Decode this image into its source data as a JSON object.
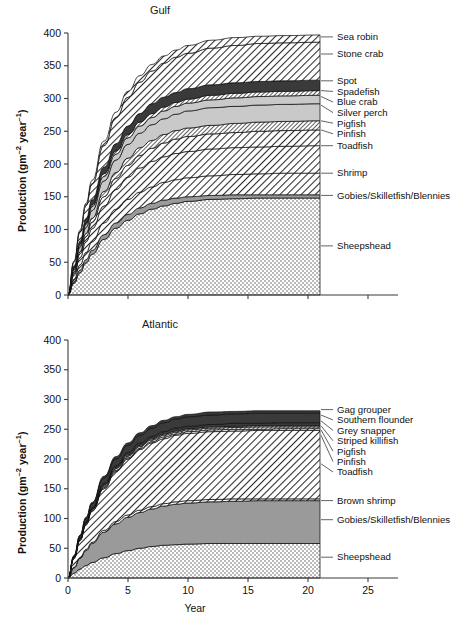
{
  "figure": {
    "axis_y_title_main": "Production (gm",
    "axis_y_title_sup1": "–2",
    "axis_y_title_mid": " year",
    "axis_y_title_sup2": "–1",
    "axis_y_title_end": ")",
    "axis_x_title": "Year",
    "ink": "#1a1a1a"
  },
  "chart_data": [
    {
      "type": "area",
      "title": "Gulf",
      "xlabel": "Year",
      "ylabel": "Production (gm−2 year−1)",
      "xlim": [
        0,
        27.5
      ],
      "ylim": [
        0,
        400
      ],
      "xticks": [
        0,
        5,
        10,
        15,
        20,
        25
      ],
      "yticks": [
        0,
        50,
        100,
        150,
        200,
        250,
        300,
        350,
        400
      ],
      "grid": false,
      "legend_position": "right-leader-lines",
      "stacked": true,
      "data_extent_x": 21,
      "x": [
        0,
        0.5,
        1,
        1.5,
        2,
        3,
        4,
        5,
        6,
        7,
        8,
        9,
        10,
        12,
        14,
        16,
        18,
        21
      ],
      "series": [
        {
          "name": "Sheepshead",
          "fill": "crosshatch",
          "label_y_value": 75,
          "cumulative": [
            0,
            18,
            34,
            49,
            62,
            85,
            102,
            114,
            124,
            131,
            136,
            140,
            143,
            146,
            147,
            148,
            148,
            148
          ]
        },
        {
          "name": "Gobies/Skilletfish/Blennies",
          "fill": "solid-mid-grey",
          "label_y_value": 152,
          "cumulative": [
            0,
            20,
            38,
            54,
            68,
            92,
            110,
            123,
            133,
            140,
            145,
            148,
            150,
            152,
            153,
            153,
            153,
            153
          ]
        },
        {
          "name": "Shrimp",
          "fill": "diagonal-hatch",
          "label_y_value": 186,
          "cumulative": [
            0,
            24,
            46,
            65,
            81,
            110,
            131,
            146,
            157,
            165,
            172,
            176,
            179,
            182,
            184,
            185,
            186,
            186
          ]
        },
        {
          "name": "Toadfish",
          "fill": "diagonal-hatch",
          "label_y_value": 228,
          "cumulative": [
            0,
            30,
            57,
            81,
            101,
            136,
            161,
            180,
            194,
            204,
            211,
            216,
            219,
            223,
            225,
            226,
            227,
            228
          ]
        },
        {
          "name": "Pinfish",
          "fill": "diagonal-hatch",
          "label_y_value": 252,
          "cumulative": [
            0,
            33,
            63,
            89,
            111,
            150,
            178,
            198,
            213,
            224,
            232,
            238,
            242,
            246,
            248,
            250,
            251,
            252
          ]
        },
        {
          "name": "Pigfish",
          "fill": "fine-hatch",
          "label_y_value": 266,
          "cumulative": [
            0,
            35,
            66,
            94,
            117,
            158,
            187,
            209,
            225,
            236,
            245,
            251,
            255,
            259,
            262,
            264,
            265,
            266
          ]
        },
        {
          "name": "Silver perch",
          "fill": "solid-light-grey",
          "label_y_value": 290,
          "cumulative": [
            0,
            38,
            73,
            103,
            129,
            174,
            206,
            230,
            247,
            260,
            269,
            276,
            281,
            286,
            288,
            290,
            291,
            292
          ]
        },
        {
          "name": "Blue crab",
          "fill": "solid-light-grey",
          "label_y_value": 303,
          "cumulative": [
            0,
            40,
            76,
            108,
            135,
            181,
            215,
            240,
            258,
            271,
            281,
            288,
            293,
            298,
            301,
            303,
            304,
            305
          ]
        },
        {
          "name": "Spadefish",
          "fill": "fine-hatch",
          "label_y_value": 312,
          "cumulative": [
            0,
            41,
            78,
            110,
            138,
            185,
            220,
            245,
            264,
            277,
            287,
            294,
            299,
            305,
            308,
            310,
            311,
            312
          ]
        },
        {
          "name": "Spot",
          "fill": "solid-dark",
          "label_y_value": 327,
          "cumulative": [
            0,
            43,
            82,
            116,
            145,
            195,
            231,
            258,
            277,
            292,
            302,
            309,
            315,
            321,
            324,
            326,
            327,
            328
          ]
        },
        {
          "name": "Stone crab",
          "fill": "diagonal-hatch",
          "label_y_value": 368,
          "cumulative": [
            0,
            50,
            96,
            136,
            170,
            228,
            271,
            302,
            325,
            342,
            354,
            363,
            369,
            377,
            381,
            384,
            385,
            386
          ]
        },
        {
          "name": "Sea robin",
          "fill": "diagonal-hatch",
          "label_y_value": 394,
          "cumulative": [
            0,
            52,
            99,
            140,
            175,
            235,
            279,
            311,
            335,
            352,
            365,
            374,
            381,
            389,
            393,
            395,
            396,
            397
          ]
        }
      ]
    },
    {
      "type": "area",
      "title": "Atlantic",
      "xlabel": "Year",
      "ylabel": "Production (gm−2 year−1)",
      "xlim": [
        0,
        27.5
      ],
      "ylim": [
        0,
        400
      ],
      "xticks": [
        0,
        5,
        10,
        15,
        20,
        25
      ],
      "yticks": [
        0,
        50,
        100,
        150,
        200,
        250,
        300,
        350,
        400
      ],
      "grid": false,
      "legend_position": "right-leader-lines",
      "stacked": true,
      "data_extent_x": 21,
      "x": [
        0,
        0.5,
        1,
        1.5,
        2,
        3,
        4,
        5,
        6,
        7,
        8,
        9,
        10,
        12,
        14,
        16,
        18,
        21
      ],
      "series": [
        {
          "name": "Sheepshead",
          "fill": "crosshatch",
          "label_y_value": 35,
          "cumulative": [
            0,
            8,
            15,
            21,
            26,
            34,
            41,
            46,
            50,
            53,
            55,
            56,
            57,
            58,
            58,
            58,
            58,
            58
          ]
        },
        {
          "name": "Gobies/Skilletfish/Blennies",
          "fill": "solid-mid-grey",
          "label_y_value": 98,
          "cumulative": [
            0,
            17,
            33,
            46,
            58,
            77,
            91,
            102,
            110,
            116,
            121,
            124,
            126,
            128,
            129,
            130,
            130,
            130
          ]
        },
        {
          "name": "Brown shrimp",
          "fill": "diagonal-hatch",
          "label_y_value": 130,
          "cumulative": [
            0,
            18,
            34,
            48,
            60,
            80,
            95,
            106,
            114,
            120,
            125,
            128,
            130,
            132,
            133,
            133,
            133,
            133
          ]
        },
        {
          "name": "Toadfish",
          "fill": "diagonal-hatch",
          "label_y_value": 192,
          "cumulative": [
            0,
            33,
            63,
            89,
            112,
            150,
            179,
            200,
            216,
            227,
            234,
            240,
            243,
            246,
            247,
            248,
            248,
            248
          ]
        },
        {
          "name": "Pinfish",
          "fill": "diagonal-hatch",
          "label_y_value": 240,
          "cumulative": [
            0,
            33,
            64,
            90,
            113,
            152,
            181,
            202,
            218,
            229,
            237,
            242,
            246,
            249,
            250,
            250,
            251,
            251
          ]
        },
        {
          "name": "Pigfish",
          "fill": "fine-hatch",
          "label_y_value": 249,
          "cumulative": [
            0,
            34,
            65,
            92,
            115,
            154,
            184,
            205,
            221,
            232,
            240,
            245,
            249,
            252,
            253,
            254,
            254,
            254
          ]
        },
        {
          "name": "Striped killifish",
          "fill": "fine-hatch",
          "label_y_value": 256,
          "cumulative": [
            0,
            34,
            66,
            93,
            116,
            156,
            186,
            207,
            223,
            234,
            242,
            247,
            251,
            254,
            255,
            256,
            256,
            256
          ]
        },
        {
          "name": "Grey snapper",
          "fill": "solid-dark",
          "label_y_value": 264,
          "cumulative": [
            0,
            35,
            67,
            95,
            118,
            159,
            189,
            211,
            227,
            238,
            246,
            252,
            255,
            258,
            260,
            260,
            261,
            261
          ]
        },
        {
          "name": "Southern flounder",
          "fill": "solid-dark",
          "label_y_value": 274,
          "cumulative": [
            0,
            37,
            71,
            100,
            125,
            168,
            200,
            223,
            240,
            252,
            261,
            267,
            271,
            274,
            276,
            277,
            277,
            277
          ]
        },
        {
          "name": "Gag grouper",
          "fill": "solid-dark",
          "label_y_value": 283,
          "cumulative": [
            0,
            38,
            72,
            102,
            127,
            171,
            204,
            227,
            244,
            256,
            265,
            271,
            275,
            279,
            280,
            281,
            281,
            281
          ]
        }
      ]
    }
  ]
}
